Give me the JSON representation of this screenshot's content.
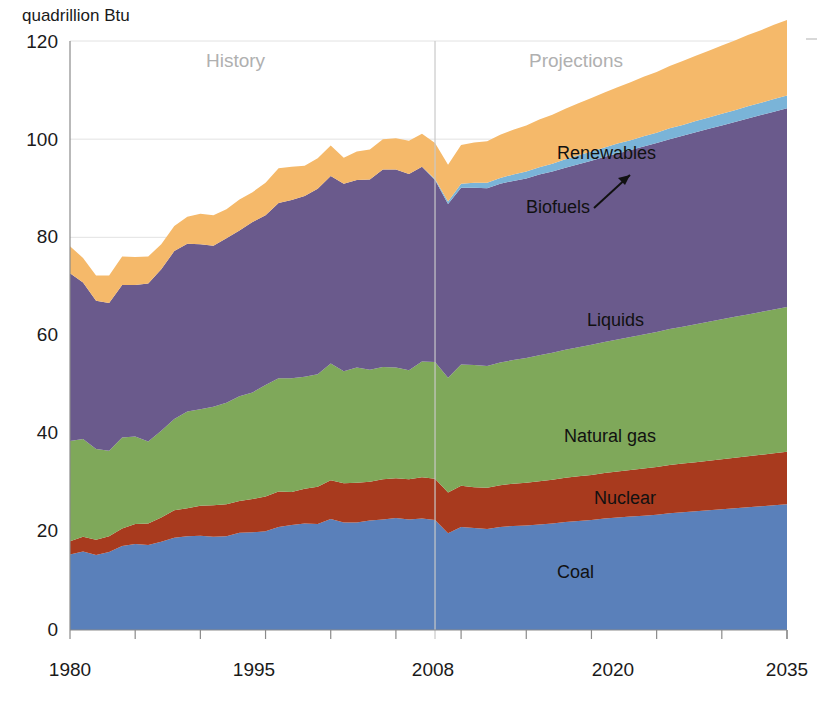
{
  "chart_data": {
    "type": "area",
    "title": "",
    "subtitle": "",
    "unit_label": "quadrillion Btu",
    "xlabel": "",
    "ylabel": "quadrillion Btu",
    "xlim": [
      1980,
      2035
    ],
    "ylim": [
      0,
      120
    ],
    "y_ticks": [
      0,
      20,
      40,
      60,
      80,
      100,
      120
    ],
    "x_ticks": [
      1980,
      1995,
      2008,
      2020,
      2035
    ],
    "x_tick_labels": [
      "1980",
      "1995",
      "2008",
      "2020",
      "2035"
    ],
    "y_tick_labels": [
      "0",
      "20",
      "40",
      "60",
      "80",
      "100",
      "120"
    ],
    "grid": "horizontal-faint",
    "legend": "inline-annotations",
    "stacked": true,
    "history_projection_divider": 2008,
    "annotations": [
      {
        "text": "History",
        "x": 1991,
        "y": 113
      },
      {
        "text": "Projections",
        "x": 2021,
        "y": 113
      },
      {
        "text": "Renewables",
        "x": 2021,
        "y": 101
      },
      {
        "text": "Biofuels",
        "x": 2012,
        "y": 89
      },
      {
        "text": "Liquids",
        "x": 2016,
        "y": 66
      },
      {
        "text": "Natural gas",
        "x": 2017,
        "y": 43
      },
      {
        "text": "Nuclear",
        "x": 2020,
        "y": 30
      },
      {
        "text": "Coal",
        "x": 2017,
        "y": 14
      }
    ],
    "x": [
      1980,
      1981,
      1982,
      1983,
      1984,
      1985,
      1986,
      1987,
      1988,
      1989,
      1990,
      1991,
      1992,
      1993,
      1994,
      1995,
      1996,
      1997,
      1998,
      1999,
      2000,
      2001,
      2002,
      2003,
      2004,
      2005,
      2006,
      2007,
      2008,
      2009,
      2010,
      2011,
      2012,
      2013,
      2014,
      2015,
      2016,
      2017,
      2018,
      2019,
      2020,
      2021,
      2022,
      2023,
      2024,
      2025,
      2026,
      2027,
      2028,
      2029,
      2030,
      2031,
      2032,
      2033,
      2034,
      2035
    ],
    "series": [
      {
        "name": "Coal",
        "color": "#5a80ba",
        "values": [
          15.4,
          16.0,
          15.3,
          15.9,
          17.1,
          17.5,
          17.3,
          18.0,
          18.8,
          19.1,
          19.2,
          19.0,
          19.1,
          19.8,
          19.9,
          20.1,
          21.0,
          21.4,
          21.7,
          21.6,
          22.6,
          21.9,
          21.9,
          22.3,
          22.5,
          22.8,
          22.5,
          22.7,
          22.4,
          19.7,
          21.0,
          20.8,
          20.6,
          21.0,
          21.2,
          21.3,
          21.5,
          21.7,
          22.0,
          22.2,
          22.4,
          22.7,
          22.9,
          23.1,
          23.3,
          23.5,
          23.8,
          24.0,
          24.2,
          24.4,
          24.6,
          24.8,
          25.0,
          25.2,
          25.4,
          25.6
        ]
      },
      {
        "name": "Nuclear",
        "color": "#a83a1e",
        "values": [
          2.7,
          3.0,
          3.1,
          3.2,
          3.6,
          4.1,
          4.4,
          4.9,
          5.6,
          5.7,
          6.1,
          6.4,
          6.5,
          6.5,
          6.8,
          7.1,
          7.2,
          6.7,
          7.1,
          7.6,
          7.9,
          8.0,
          8.1,
          7.9,
          8.2,
          8.1,
          8.2,
          8.4,
          8.4,
          8.3,
          8.4,
          8.3,
          8.4,
          8.5,
          8.6,
          8.7,
          8.8,
          8.9,
          9.0,
          9.1,
          9.2,
          9.3,
          9.4,
          9.5,
          9.6,
          9.7,
          9.8,
          9.9,
          10.0,
          10.1,
          10.2,
          10.3,
          10.4,
          10.5,
          10.6,
          10.7
        ]
      },
      {
        "name": "Natural gas",
        "color": "#7fa85a",
        "values": [
          20.4,
          19.9,
          18.5,
          17.4,
          18.5,
          17.8,
          16.7,
          17.7,
          18.6,
          19.7,
          19.7,
          20.1,
          20.7,
          21.3,
          21.7,
          22.7,
          23.1,
          23.2,
          22.8,
          22.9,
          23.8,
          22.8,
          23.5,
          22.8,
          22.9,
          22.6,
          22.2,
          23.6,
          23.8,
          23.4,
          24.7,
          24.9,
          24.8,
          25.0,
          25.2,
          25.4,
          25.7,
          25.9,
          26.1,
          26.3,
          26.5,
          26.7,
          26.9,
          27.1,
          27.3,
          27.5,
          27.7,
          27.9,
          28.1,
          28.3,
          28.5,
          28.7,
          28.9,
          29.1,
          29.3,
          29.5
        ]
      },
      {
        "name": "Liquids",
        "color": "#6a5a8c",
        "values": [
          34.2,
          31.9,
          30.2,
          30.1,
          31.1,
          30.9,
          32.2,
          32.9,
          34.2,
          34.2,
          33.6,
          32.8,
          33.5,
          33.8,
          34.7,
          34.6,
          35.7,
          36.3,
          36.8,
          37.8,
          38.2,
          38.2,
          38.2,
          38.8,
          40.2,
          40.3,
          40.0,
          39.7,
          37.1,
          35.4,
          36.0,
          36.1,
          36.2,
          36.4,
          36.5,
          36.6,
          36.8,
          36.9,
          37.1,
          37.3,
          37.5,
          37.7,
          37.9,
          38.1,
          38.3,
          38.5,
          38.7,
          38.9,
          39.1,
          39.3,
          39.5,
          39.7,
          39.9,
          40.1,
          40.3,
          40.5
        ]
      },
      {
        "name": "Biofuels",
        "color": "#7ab4d8",
        "values": [
          0.0,
          0.0,
          0.0,
          0.0,
          0.0,
          0.0,
          0.0,
          0.0,
          0.0,
          0.0,
          0.0,
          0.0,
          0.0,
          0.0,
          0.0,
          0.0,
          0.0,
          0.0,
          0.0,
          0.0,
          0.0,
          0.0,
          0.0,
          0.0,
          0.0,
          0.0,
          0.0,
          0.0,
          0.2,
          0.5,
          0.8,
          1.0,
          1.1,
          1.2,
          1.3,
          1.4,
          1.5,
          1.6,
          1.7,
          1.8,
          1.9,
          1.9,
          2.0,
          2.0,
          2.1,
          2.1,
          2.2,
          2.2,
          2.3,
          2.3,
          2.4,
          2.4,
          2.5,
          2.5,
          2.6,
          2.6
        ]
      },
      {
        "name": "Renewables",
        "color": "#f5b96a",
        "values": [
          5.5,
          5.0,
          5.1,
          5.6,
          5.8,
          5.7,
          5.5,
          5.1,
          5.1,
          5.5,
          6.2,
          6.2,
          5.9,
          6.3,
          6.1,
          6.6,
          7.1,
          6.8,
          6.2,
          6.2,
          6.2,
          5.3,
          5.8,
          6.1,
          6.2,
          6.4,
          6.8,
          6.7,
          7.3,
          7.5,
          7.9,
          8.2,
          8.5,
          8.8,
          9.1,
          9.4,
          9.7,
          10.0,
          10.3,
          10.6,
          10.9,
          11.2,
          11.5,
          11.8,
          12.1,
          12.4,
          12.7,
          13.0,
          13.3,
          13.6,
          13.9,
          14.2,
          14.5,
          14.8,
          15.1,
          15.4
        ]
      }
    ],
    "totals_note": "Stacked total rises from about 78 in 1980 to about 114 in 2035, peaking near 101 in 2008 and dipping to about 95 in 2009."
  },
  "labels": {
    "unit": "quadrillion Btu",
    "history": "History",
    "projections": "Projections",
    "renewables": "Renewables",
    "biofuels": "Biofuels",
    "liquids": "Liquids",
    "natural_gas": "Natural gas",
    "nuclear": "Nuclear",
    "coal": "Coal",
    "y0": "0",
    "y20": "20",
    "y40": "40",
    "y60": "60",
    "y80": "80",
    "y100": "100",
    "y120": "120",
    "x1980": "1980",
    "x1995": "1995",
    "x2008": "2008",
    "x2020": "2020",
    "x2035": "2035"
  },
  "colors": {
    "coal": "#5a80ba",
    "nuclear": "#a83a1e",
    "natural_gas": "#7fa85a",
    "liquids": "#6a5a8c",
    "biofuels": "#7ab4d8",
    "renewables": "#f5b96a",
    "grid": "#e2e2e2",
    "axis": "#8a8a8a",
    "period_text": "#b0b0b0",
    "background": "#ffffff"
  }
}
